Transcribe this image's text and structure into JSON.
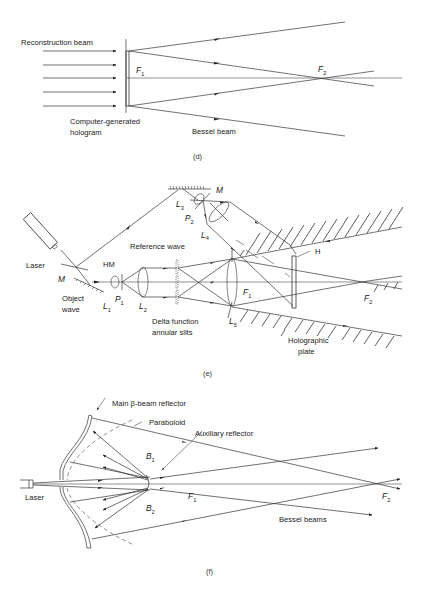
{
  "figure": {
    "panels": [
      {
        "id": "d",
        "caption": "(d)",
        "labels": {
          "reconstruction_beam": "Reconstruction beam",
          "hologram_line1": "Computer-generated",
          "hologram_line2": "hologram",
          "bessel_beam": "Bessel beam",
          "f1": "F",
          "f1_sub": "1",
          "f2": "F",
          "f2_sub": "2"
        }
      },
      {
        "id": "e",
        "caption": "(e)",
        "labels": {
          "mirror_top": "M",
          "l3": "L",
          "l3_sub": "3",
          "p2": "P",
          "p2_sub": "2",
          "l4": "L",
          "l4_sub": "4",
          "reference_wave": "Reference wave",
          "h": "H",
          "laser": "Laser",
          "hm": "HM",
          "mirror_left": "M",
          "object_line1": "Object",
          "object_line2": "wave",
          "l1": "L",
          "l1_sub": "1",
          "p1": "P",
          "p1_sub": "1",
          "l2": "L",
          "l2_sub": "2",
          "delta_line1": "Delta function",
          "delta_line2": "annular slits",
          "l5": "L",
          "l5_sub": "5",
          "f1": "F",
          "f1_sub": "1",
          "f2": "F",
          "f2_sub": "2",
          "plate_line1": "Holographic",
          "plate_line2": "plate"
        }
      },
      {
        "id": "f",
        "caption": "(f)",
        "labels": {
          "main_reflector": "Main β-beam reflector",
          "paraboloid": "Paraboloid",
          "auxiliary_reflector": "Auxiliary reflector",
          "b1": "B",
          "b1_sub": "1",
          "b2": "B",
          "b2_sub": "2",
          "laser": "Laser",
          "f1": "F",
          "f1_sub": "1",
          "f2": "F",
          "f2_sub": "2",
          "bessel_beams": "Bessel beams"
        }
      }
    ]
  }
}
